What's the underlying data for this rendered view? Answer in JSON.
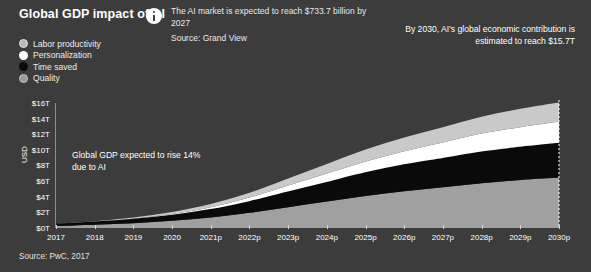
{
  "header": {
    "title": "Global GDP impact of AI",
    "info_icon": "info-circle-icon",
    "info_text": "The AI market is expected to reach $733.7 billion by 2027",
    "info_source": "Source: Grand View"
  },
  "callout": {
    "text": "By 2030, AI's global economic contribution is estimated to reach $15.7T"
  },
  "annotation": {
    "text": "Global GDP expected to rise 14% due to AI"
  },
  "footer": {
    "source": "Source: PwC, 2017"
  },
  "colors": {
    "background": "#3c3c3c",
    "labor_productivity": "#c9c9c9",
    "personalization": "#ffffff",
    "time_saved": "#0a0a0a",
    "quality": "#a0a0a0",
    "axis": "#8e8e8e",
    "text": "#ffffff"
  },
  "chart_data": {
    "type": "area",
    "title": "Global GDP impact of AI",
    "xlabel": "",
    "ylabel": "USD",
    "ylim": [
      0,
      16
    ],
    "yticks": [
      "$0T",
      "$2T",
      "$4T",
      "$6T",
      "$8T",
      "$10T",
      "$12T",
      "$14T",
      "$16T"
    ],
    "ytick_values": [
      0,
      2,
      4,
      6,
      8,
      10,
      12,
      14,
      16
    ],
    "grid": false,
    "legend_position": "top-left",
    "stacked": true,
    "categories": [
      "2017",
      "2018",
      "2019",
      "2020",
      "2021p",
      "2022p",
      "2023p",
      "2024p",
      "2025p",
      "2026p",
      "2027p",
      "2028p",
      "2029p",
      "2030p"
    ],
    "series": [
      {
        "name": "Quality",
        "color": "#a0a0a0",
        "values": [
          0.25,
          0.4,
          0.6,
          0.9,
          1.3,
          1.9,
          2.6,
          3.3,
          4.0,
          4.6,
          5.1,
          5.6,
          6.0,
          6.3
        ]
      },
      {
        "name": "Time saved",
        "color": "#0a0a0a",
        "values": [
          0.15,
          0.25,
          0.4,
          0.6,
          0.9,
          1.3,
          1.8,
          2.3,
          2.8,
          3.2,
          3.5,
          3.8,
          4.0,
          4.2
        ]
      },
      {
        "name": "Personalization",
        "color": "#ffffff",
        "values": [
          0.05,
          0.1,
          0.15,
          0.25,
          0.4,
          0.6,
          0.9,
          1.2,
          1.5,
          1.8,
          2.1,
          2.4,
          2.6,
          2.8
        ]
      },
      {
        "name": "Labor productivity",
        "color": "#c9c9c9",
        "values": [
          0.05,
          0.1,
          0.15,
          0.25,
          0.4,
          0.6,
          0.9,
          1.2,
          1.5,
          1.7,
          1.9,
          2.1,
          2.3,
          2.4
        ]
      }
    ],
    "total_line": {
      "name": "Time saved cumulative line",
      "color": "#0a0a0a",
      "values": [
        0.4,
        0.65,
        1.0,
        1.5,
        2.2,
        3.2,
        4.4,
        5.6,
        6.8,
        7.8,
        8.6,
        9.4,
        10.0,
        10.5
      ]
    },
    "annotations": [
      {
        "text": "Global GDP expected to rise 14% due to AI"
      },
      {
        "text": "By 2030, AI's global economic contribution is estimated to reach $15.7T"
      }
    ],
    "source": "Source: PwC, 2017"
  },
  "legend": {
    "items": [
      {
        "label": "Labor productivity",
        "color": "#c9c9c9",
        "marker": "circle-outline"
      },
      {
        "label": "Personalization",
        "color": "#ffffff",
        "marker": "circle-filled"
      },
      {
        "label": "Time saved",
        "color": "#0a0a0a",
        "marker": "circle-filled"
      },
      {
        "label": "Quality",
        "color": "#a0a0a0",
        "marker": "circle-outline"
      }
    ]
  }
}
